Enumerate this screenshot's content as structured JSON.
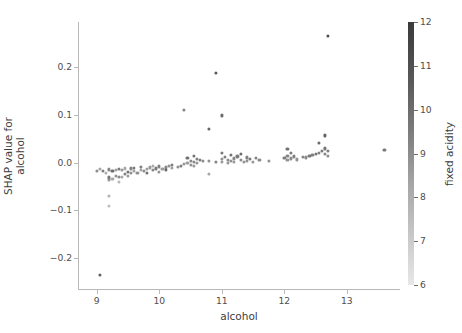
{
  "chart_data": {
    "type": "scatter",
    "title": "",
    "xlabel": "alcohol",
    "ylabel_lines": [
      "SHAP value for",
      "alcohol"
    ],
    "ylabel": "SHAP value for alcohol",
    "xlim": [
      8.7,
      13.85
    ],
    "ylim": [
      -0.265,
      0.295
    ],
    "xticks": [
      9,
      10,
      11,
      12,
      13
    ],
    "xticklabels": [
      "9",
      "10",
      "11",
      "12",
      "13"
    ],
    "yticks": [
      0.2,
      0.1,
      0.0,
      -0.1,
      -0.2
    ],
    "yticklabels": [
      "0.2",
      "0.1",
      "0.0",
      "−0.1",
      "−0.2"
    ],
    "grid": false,
    "legend": "none",
    "colorbar": {
      "label": "fixed acidity",
      "vmin": 6,
      "vmax": 12,
      "ticks": [
        6,
        7,
        8,
        9,
        10,
        11,
        12
      ],
      "ticklabels": [
        "6",
        "7",
        "8",
        "9",
        "10",
        "11",
        "12"
      ],
      "colormap": "grayscale",
      "low_color": "#e8e8e8",
      "high_color": "#3a3a3a",
      "position": "right",
      "orientation": "vertical"
    },
    "marker": {
      "shape": "circle",
      "size_px": 3.2,
      "alpha": 0.85
    },
    "points": [
      {
        "x": 9.05,
        "y": -0.235,
        "c": 11.0
      },
      {
        "x": 9.0,
        "y": -0.018,
        "c": 9.4
      },
      {
        "x": 9.05,
        "y": -0.013,
        "c": 8.6
      },
      {
        "x": 9.1,
        "y": -0.018,
        "c": 9.9
      },
      {
        "x": 9.15,
        "y": -0.021,
        "c": 8.2
      },
      {
        "x": 9.2,
        "y": -0.07,
        "c": 8.0
      },
      {
        "x": 9.2,
        "y": -0.091,
        "c": 7.6
      },
      {
        "x": 9.2,
        "y": -0.031,
        "c": 10.2
      },
      {
        "x": 9.2,
        "y": -0.037,
        "c": 9.0
      },
      {
        "x": 9.2,
        "y": -0.014,
        "c": 9.6
      },
      {
        "x": 9.25,
        "y": -0.034,
        "c": 8.4
      },
      {
        "x": 9.25,
        "y": -0.018,
        "c": 10.6
      },
      {
        "x": 9.3,
        "y": -0.027,
        "c": 9.2
      },
      {
        "x": 9.3,
        "y": -0.015,
        "c": 8.8
      },
      {
        "x": 9.35,
        "y": -0.041,
        "c": 7.9
      },
      {
        "x": 9.35,
        "y": -0.03,
        "c": 9.5
      },
      {
        "x": 9.35,
        "y": -0.013,
        "c": 10.1
      },
      {
        "x": 9.4,
        "y": -0.03,
        "c": 8.5
      },
      {
        "x": 9.4,
        "y": -0.016,
        "c": 9.1
      },
      {
        "x": 9.45,
        "y": -0.023,
        "c": 9.8
      },
      {
        "x": 9.45,
        "y": -0.012,
        "c": 8.3
      },
      {
        "x": 9.5,
        "y": -0.019,
        "c": 10.4
      },
      {
        "x": 9.5,
        "y": -0.028,
        "c": 8.9
      },
      {
        "x": 9.55,
        "y": -0.021,
        "c": 9.3
      },
      {
        "x": 9.55,
        "y": -0.012,
        "c": 9.7
      },
      {
        "x": 9.6,
        "y": -0.018,
        "c": 8.7
      },
      {
        "x": 9.6,
        "y": -0.011,
        "c": 10.0
      },
      {
        "x": 9.65,
        "y": -0.022,
        "c": 9.2
      },
      {
        "x": 9.7,
        "y": -0.015,
        "c": 8.6
      },
      {
        "x": 9.7,
        "y": -0.009,
        "c": 9.9
      },
      {
        "x": 9.75,
        "y": -0.018,
        "c": 9.4
      },
      {
        "x": 9.8,
        "y": -0.013,
        "c": 8.8
      },
      {
        "x": 9.8,
        "y": -0.022,
        "c": 10.3
      },
      {
        "x": 9.85,
        "y": -0.01,
        "c": 9.0
      },
      {
        "x": 9.9,
        "y": -0.016,
        "c": 9.6
      },
      {
        "x": 9.9,
        "y": -0.007,
        "c": 8.4
      },
      {
        "x": 9.95,
        "y": -0.012,
        "c": 10.1
      },
      {
        "x": 10.0,
        "y": -0.019,
        "c": 9.1
      },
      {
        "x": 10.0,
        "y": -0.008,
        "c": 9.8
      },
      {
        "x": 10.05,
        "y": -0.013,
        "c": 8.9
      },
      {
        "x": 10.1,
        "y": -0.01,
        "c": 9.5
      },
      {
        "x": 10.1,
        "y": -0.016,
        "c": 10.5
      },
      {
        "x": 10.15,
        "y": -0.007,
        "c": 9.2
      },
      {
        "x": 10.2,
        "y": -0.011,
        "c": 8.7
      },
      {
        "x": 10.2,
        "y": -0.005,
        "c": 9.9
      },
      {
        "x": 10.3,
        "y": -0.009,
        "c": 9.3
      },
      {
        "x": 10.35,
        "y": -0.006,
        "c": 10.0
      },
      {
        "x": 10.4,
        "y": 0.11,
        "c": 9.7
      },
      {
        "x": 10.4,
        "y": -0.003,
        "c": 9.0
      },
      {
        "x": 10.45,
        "y": 0.01,
        "c": 10.4
      },
      {
        "x": 10.45,
        "y": -0.001,
        "c": 8.8
      },
      {
        "x": 10.5,
        "y": 0.004,
        "c": 9.6
      },
      {
        "x": 10.5,
        "y": -0.004,
        "c": 9.2
      },
      {
        "x": 10.55,
        "y": 0.014,
        "c": 10.2
      },
      {
        "x": 10.55,
        "y": 0.002,
        "c": 9.5
      },
      {
        "x": 10.55,
        "y": -0.007,
        "c": 8.9
      },
      {
        "x": 10.6,
        "y": 0.008,
        "c": 9.8
      },
      {
        "x": 10.6,
        "y": 0.0,
        "c": 9.1
      },
      {
        "x": 10.65,
        "y": 0.006,
        "c": 10.0
      },
      {
        "x": 10.7,
        "y": 0.003,
        "c": 9.4
      },
      {
        "x": 10.8,
        "y": 0.071,
        "c": 10.8
      },
      {
        "x": 10.8,
        "y": 0.004,
        "c": 9.2
      },
      {
        "x": 10.8,
        "y": -0.023,
        "c": 8.5
      },
      {
        "x": 10.9,
        "y": 0.188,
        "c": 11.2
      },
      {
        "x": 10.9,
        "y": 0.002,
        "c": 9.7
      },
      {
        "x": 11.0,
        "y": 0.099,
        "c": 10.6
      },
      {
        "x": 11.0,
        "y": 0.021,
        "c": 10.1
      },
      {
        "x": 11.0,
        "y": 0.008,
        "c": 9.3
      },
      {
        "x": 11.0,
        "y": 0.001,
        "c": 8.9
      },
      {
        "x": 11.05,
        "y": 0.012,
        "c": 9.9
      },
      {
        "x": 11.1,
        "y": 0.006,
        "c": 9.5
      },
      {
        "x": 11.1,
        "y": 0.0,
        "c": 9.0
      },
      {
        "x": 11.15,
        "y": 0.016,
        "c": 10.3
      },
      {
        "x": 11.15,
        "y": 0.004,
        "c": 9.2
      },
      {
        "x": 11.2,
        "y": 0.009,
        "c": 9.6
      },
      {
        "x": 11.2,
        "y": 0.001,
        "c": 8.8
      },
      {
        "x": 11.25,
        "y": 0.013,
        "c": 10.0
      },
      {
        "x": 11.3,
        "y": 0.006,
        "c": 9.4
      },
      {
        "x": 11.3,
        "y": 0.019,
        "c": 10.5
      },
      {
        "x": 11.35,
        "y": 0.002,
        "c": 9.1
      },
      {
        "x": 11.4,
        "y": 0.011,
        "c": 9.8
      },
      {
        "x": 11.4,
        "y": 0.004,
        "c": 9.3
      },
      {
        "x": 11.45,
        "y": 0.008,
        "c": 10.2
      },
      {
        "x": 11.5,
        "y": 0.002,
        "c": 9.0
      },
      {
        "x": 11.55,
        "y": 0.01,
        "c": 9.7
      },
      {
        "x": 11.6,
        "y": 0.005,
        "c": 9.5
      },
      {
        "x": 11.75,
        "y": 0.004,
        "c": 9.2
      },
      {
        "x": 12.0,
        "y": 0.01,
        "c": 9.9
      },
      {
        "x": 12.05,
        "y": 0.028,
        "c": 10.4
      },
      {
        "x": 12.05,
        "y": 0.015,
        "c": 9.6
      },
      {
        "x": 12.05,
        "y": 0.006,
        "c": 9.1
      },
      {
        "x": 12.1,
        "y": 0.02,
        "c": 10.0
      },
      {
        "x": 12.1,
        "y": 0.009,
        "c": 9.4
      },
      {
        "x": 12.15,
        "y": 0.013,
        "c": 9.8
      },
      {
        "x": 12.2,
        "y": 0.007,
        "c": 9.2
      },
      {
        "x": 12.3,
        "y": 0.012,
        "c": 9.7
      },
      {
        "x": 12.35,
        "y": 0.011,
        "c": 9.5
      },
      {
        "x": 12.4,
        "y": 0.014,
        "c": 10.1
      },
      {
        "x": 12.45,
        "y": 0.016,
        "c": 9.9
      },
      {
        "x": 12.5,
        "y": 0.018,
        "c": 10.2
      },
      {
        "x": 12.55,
        "y": 0.041,
        "c": 10.6
      },
      {
        "x": 12.55,
        "y": 0.02,
        "c": 9.8
      },
      {
        "x": 12.6,
        "y": 0.025,
        "c": 10.0
      },
      {
        "x": 12.65,
        "y": 0.057,
        "c": 10.9
      },
      {
        "x": 12.65,
        "y": 0.03,
        "c": 10.3
      },
      {
        "x": 12.65,
        "y": 0.019,
        "c": 9.6
      },
      {
        "x": 12.7,
        "y": 0.265,
        "c": 11.6
      },
      {
        "x": 12.7,
        "y": 0.024,
        "c": 9.9
      },
      {
        "x": 12.7,
        "y": 0.015,
        "c": 9.3
      },
      {
        "x": 13.6,
        "y": 0.027,
        "c": 10.2
      }
    ]
  }
}
